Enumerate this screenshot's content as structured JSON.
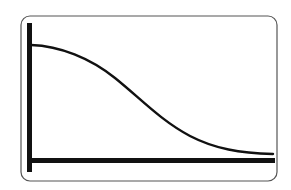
{
  "diagram": {
    "type": "line-graph-sketch",
    "frame": {
      "x": 21,
      "y": 16,
      "width": 256,
      "height": 165,
      "radius": 9,
      "stroke": "#555555",
      "stroke_width": 1.2
    },
    "axes": {
      "color": "#111111",
      "y_axis": {
        "x": 29.5,
        "y1": 23,
        "y2": 172,
        "width": 5
      },
      "x_axis": {
        "y": 160.5,
        "x1": 29,
        "x2": 275,
        "width": 5
      },
      "labels": {
        "x": "",
        "y": ""
      },
      "ticks": false
    },
    "curve": {
      "color": "#111111",
      "width": 2.4,
      "shape": "decreasing-sigmoid",
      "path": "M 31 45 C 60 46, 90 58, 115 78 C 140 98, 160 120, 190 136 C 215 149, 240 153, 273 154"
    }
  },
  "chart_data": {
    "type": "line",
    "title": "",
    "xlabel": "",
    "ylabel": "",
    "grid": false,
    "legend": null,
    "series": [
      {
        "name": "curve",
        "x": [
          0,
          0.1,
          0.2,
          0.3,
          0.4,
          0.5,
          0.6,
          0.7,
          0.8,
          0.9,
          1.0
        ],
        "values": [
          1.0,
          0.97,
          0.89,
          0.77,
          0.62,
          0.46,
          0.31,
          0.19,
          0.1,
          0.05,
          0.04
        ]
      }
    ],
    "xlim": [
      0,
      1
    ],
    "ylim": [
      0,
      1.1
    ]
  }
}
